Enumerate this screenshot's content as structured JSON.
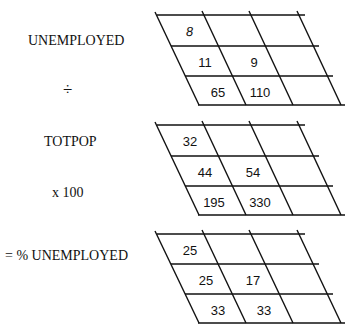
{
  "labels": {
    "unemployed": "UNEMPLOYED",
    "divide": "÷",
    "totpop": "TOTPOP",
    "times": "x 100",
    "result": "= % UNEMPLOYED"
  },
  "grids": [
    {
      "name": "UNEMPLOYED",
      "rows": [
        [
          "8",
          "",
          ""
        ],
        [
          "11",
          "9",
          ""
        ],
        [
          "65",
          "110",
          ""
        ]
      ]
    },
    {
      "name": "TOTPOP",
      "rows": [
        [
          "32",
          "",
          ""
        ],
        [
          "44",
          "54",
          ""
        ],
        [
          "195",
          "330",
          ""
        ]
      ]
    },
    {
      "name": "% UNEMPLOYED",
      "rows": [
        [
          "25",
          "",
          ""
        ],
        [
          "25",
          "17",
          ""
        ],
        [
          "33",
          "33",
          ""
        ]
      ]
    }
  ]
}
